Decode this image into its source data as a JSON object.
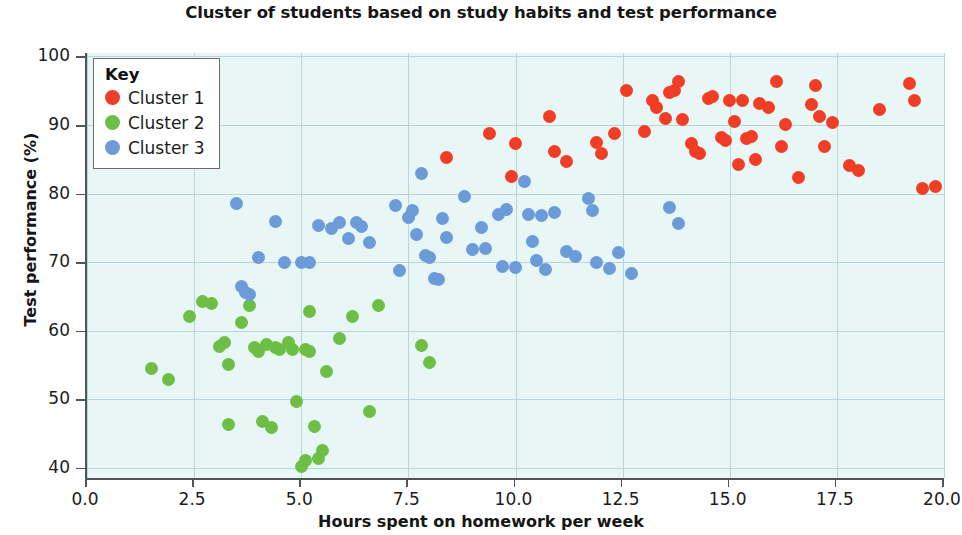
{
  "chart_data": {
    "type": "scatter",
    "title": "Cluster of students based on study habits and test performance",
    "xlabel": "Hours spent on homework per week",
    "ylabel": "Test performance (%)",
    "xlim": [
      0.0,
      20.0
    ],
    "ylim": [
      38.5,
      100.5
    ],
    "xticks": [
      "0.0",
      "2.5",
      "5.0",
      "7.5",
      "10.0",
      "12.5",
      "15.0",
      "17.5",
      "20.0"
    ],
    "xtick_values": [
      0.0,
      2.5,
      5.0,
      7.5,
      10.0,
      12.5,
      15.0,
      17.5,
      20.0
    ],
    "yticks": [
      "40",
      "50",
      "60",
      "70",
      "80",
      "90",
      "100"
    ],
    "ytick_values": [
      40,
      50,
      60,
      70,
      80,
      90,
      100
    ],
    "grid": true,
    "legend_position": "upper left",
    "legend_title": "Key",
    "plot_background": "#e9f6f6",
    "gridline_color": "#b9d6dd",
    "series": [
      {
        "name": "Cluster 1",
        "color": "#f03e26",
        "points": [
          [
            8.4,
            85.2
          ],
          [
            9.4,
            88.8
          ],
          [
            9.9,
            82.5
          ],
          [
            10.0,
            87.3
          ],
          [
            10.8,
            91.3
          ],
          [
            10.9,
            86.2
          ],
          [
            11.2,
            84.6
          ],
          [
            11.9,
            87.5
          ],
          [
            12.0,
            85.8
          ],
          [
            12.3,
            88.8
          ],
          [
            12.6,
            95.0
          ],
          [
            13.0,
            89.0
          ],
          [
            13.2,
            93.6
          ],
          [
            13.3,
            92.6
          ],
          [
            13.5,
            91.0
          ],
          [
            13.6,
            94.7
          ],
          [
            13.7,
            95.0
          ],
          [
            13.8,
            96.3
          ],
          [
            13.9,
            90.8
          ],
          [
            14.1,
            87.3
          ],
          [
            14.2,
            86.2
          ],
          [
            14.3,
            85.9
          ],
          [
            14.5,
            93.9
          ],
          [
            14.6,
            94.2
          ],
          [
            14.8,
            88.2
          ],
          [
            14.9,
            87.8
          ],
          [
            15.0,
            93.6
          ],
          [
            15.1,
            90.5
          ],
          [
            15.2,
            84.2
          ],
          [
            15.3,
            93.5
          ],
          [
            15.4,
            88.0
          ],
          [
            15.5,
            88.3
          ],
          [
            15.6,
            85.0
          ],
          [
            15.7,
            93.2
          ],
          [
            15.9,
            92.5
          ],
          [
            16.1,
            96.4
          ],
          [
            16.2,
            86.8
          ],
          [
            16.3,
            90.1
          ],
          [
            16.6,
            82.3
          ],
          [
            16.9,
            93.0
          ],
          [
            17.0,
            95.8
          ],
          [
            17.1,
            91.3
          ],
          [
            17.2,
            86.8
          ],
          [
            17.4,
            90.3
          ],
          [
            17.8,
            84.1
          ],
          [
            18.0,
            83.3
          ],
          [
            18.5,
            92.2
          ],
          [
            19.2,
            96.0
          ],
          [
            19.3,
            93.5
          ],
          [
            19.5,
            80.8
          ],
          [
            19.8,
            81.0
          ]
        ]
      },
      {
        "name": "Cluster 2",
        "color": "#6cbe45",
        "points": [
          [
            1.5,
            54.5
          ],
          [
            1.9,
            52.8
          ],
          [
            2.4,
            62.0
          ],
          [
            2.7,
            64.2
          ],
          [
            2.9,
            64.0
          ],
          [
            3.1,
            57.7
          ],
          [
            3.2,
            58.3
          ],
          [
            3.3,
            55.0
          ],
          [
            3.3,
            46.3
          ],
          [
            3.6,
            61.2
          ],
          [
            3.8,
            63.6
          ],
          [
            3.9,
            57.5
          ],
          [
            4.0,
            57.0
          ],
          [
            4.1,
            46.8
          ],
          [
            4.2,
            58.0
          ],
          [
            4.3,
            45.8
          ],
          [
            4.4,
            57.5
          ],
          [
            4.5,
            57.2
          ],
          [
            4.7,
            58.3
          ],
          [
            4.8,
            57.2
          ],
          [
            4.9,
            49.6
          ],
          [
            5.0,
            40.2
          ],
          [
            5.1,
            57.3
          ],
          [
            5.1,
            41.0
          ],
          [
            5.2,
            57.0
          ],
          [
            5.2,
            62.8
          ],
          [
            5.3,
            46.0
          ],
          [
            5.4,
            41.3
          ],
          [
            5.5,
            42.5
          ],
          [
            5.6,
            54.0
          ],
          [
            5.9,
            58.8
          ],
          [
            6.2,
            62.0
          ],
          [
            6.6,
            48.2
          ],
          [
            6.8,
            63.7
          ],
          [
            7.8,
            57.8
          ],
          [
            8.0,
            55.3
          ]
        ]
      },
      {
        "name": "Cluster 3",
        "color": "#6b9bd8",
        "points": [
          [
            3.5,
            78.5
          ],
          [
            3.6,
            66.5
          ],
          [
            3.7,
            65.5
          ],
          [
            3.8,
            65.2
          ],
          [
            4.0,
            70.7
          ],
          [
            4.4,
            75.9
          ],
          [
            4.6,
            70.0
          ],
          [
            5.0,
            70.0
          ],
          [
            5.2,
            69.9
          ],
          [
            5.4,
            75.4
          ],
          [
            5.7,
            74.9
          ],
          [
            5.9,
            75.8
          ],
          [
            6.1,
            73.5
          ],
          [
            6.3,
            75.8
          ],
          [
            6.4,
            75.2
          ],
          [
            6.6,
            72.9
          ],
          [
            7.2,
            78.2
          ],
          [
            7.3,
            68.7
          ],
          [
            7.5,
            76.5
          ],
          [
            7.6,
            77.5
          ],
          [
            7.7,
            74.0
          ],
          [
            7.8,
            82.9
          ],
          [
            7.9,
            71.0
          ],
          [
            8.0,
            70.6
          ],
          [
            8.1,
            67.6
          ],
          [
            8.2,
            67.4
          ],
          [
            8.3,
            76.3
          ],
          [
            8.4,
            73.6
          ],
          [
            8.8,
            79.5
          ],
          [
            9.0,
            71.8
          ],
          [
            9.2,
            75.0
          ],
          [
            9.3,
            72.0
          ],
          [
            9.6,
            77.0
          ],
          [
            9.7,
            69.3
          ],
          [
            9.8,
            77.7
          ],
          [
            10.0,
            69.2
          ],
          [
            10.2,
            81.8
          ],
          [
            10.3,
            77.0
          ],
          [
            10.4,
            73.0
          ],
          [
            10.5,
            70.3
          ],
          [
            10.6,
            76.8
          ],
          [
            10.7,
            68.9
          ],
          [
            10.9,
            77.2
          ],
          [
            11.2,
            71.5
          ],
          [
            11.4,
            70.8
          ],
          [
            11.7,
            79.3
          ],
          [
            11.8,
            77.5
          ],
          [
            11.9,
            70.0
          ],
          [
            12.2,
            69.0
          ],
          [
            12.4,
            71.4
          ],
          [
            12.7,
            68.4
          ],
          [
            13.6,
            78.0
          ],
          [
            13.8,
            75.7
          ]
        ]
      }
    ]
  }
}
